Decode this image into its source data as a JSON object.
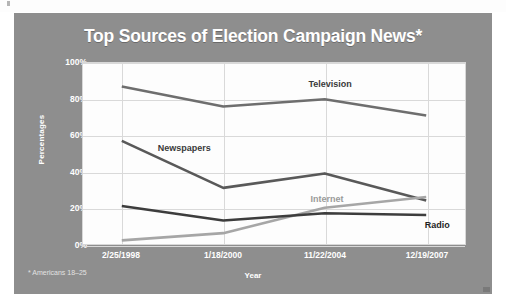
{
  "figure": {
    "title": "Top Sources of Election Campaign News*",
    "footnote": "* Americans 18–25"
  },
  "chart_data": {
    "type": "line",
    "title": "Top Sources of Election Campaign News*",
    "xlabel": "Year",
    "ylabel": "Percentages",
    "categories": [
      "2/25/1998",
      "1/18/2000",
      "11/22/2004",
      "12/19/2007"
    ],
    "ylim": [
      0,
      100
    ],
    "yticks": [
      "0%",
      "20%",
      "40%",
      "60%",
      "80%",
      "100%"
    ],
    "ytick_values": [
      0,
      20,
      40,
      60,
      80,
      100
    ],
    "grid": true,
    "legend": "inline-labels",
    "series": [
      {
        "name": "Television",
        "values": [
          87,
          76,
          80,
          71
        ],
        "color": "#6e6e6e"
      },
      {
        "name": "Newspapers",
        "values": [
          57,
          31,
          39,
          24
        ],
        "color": "#595959"
      },
      {
        "name": "Internet",
        "values": [
          2,
          6,
          20,
          26
        ],
        "color": "#a6a6a6"
      },
      {
        "name": "Radio",
        "values": [
          21,
          13,
          17,
          16
        ],
        "color": "#3d3d3d"
      }
    ],
    "annotations": [
      {
        "label": "Television",
        "x": 2.05,
        "y": 88,
        "color": "#3a3a3a"
      },
      {
        "label": "Newspapers",
        "x": 0.62,
        "y": 53,
        "color": "#3a3a3a"
      },
      {
        "label": "Internet",
        "x": 2.02,
        "y": 25,
        "color": "#9a9a9a"
      },
      {
        "label": "Radio",
        "x": 3.1,
        "y": 11,
        "color": "#1f1f1f"
      }
    ]
  }
}
